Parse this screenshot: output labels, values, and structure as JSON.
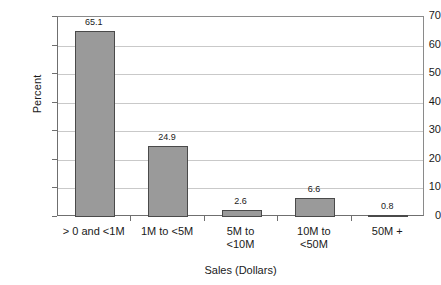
{
  "chart_data": {
    "type": "bar",
    "title": "",
    "xlabel": "Sales (Dollars)",
    "ylabel": "Percent",
    "categories": [
      "> 0 and <1M",
      "1M to <5M",
      "5M to\n<10M",
      "10M to\n<50M",
      "50M +"
    ],
    "values": [
      65.1,
      24.9,
      2.6,
      6.6,
      0.8
    ],
    "value_labels": [
      "65.1",
      "24.9",
      "2.6",
      "6.6",
      "0.8"
    ],
    "ylim": [
      0,
      70
    ],
    "yticks": [
      0,
      10,
      20,
      30,
      40,
      50,
      60,
      70
    ],
    "ytick_labels": [
      "0",
      "10",
      "20",
      "30",
      "40",
      "50",
      "60",
      "70"
    ],
    "grid": true,
    "grid_axis": "y",
    "legend": false,
    "bar_color": "#9a9a9a",
    "bar_border_color": "#4a4a4a",
    "grid_color": "#c9c9c9",
    "axis_color": "#6f6f6f",
    "text_color": "#1a1a1a",
    "background": "#ffffff"
  }
}
